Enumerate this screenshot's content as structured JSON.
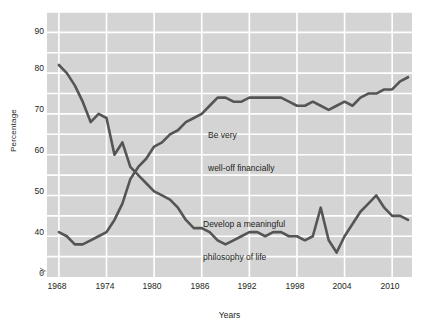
{
  "chart_data": {
    "type": "line",
    "title": "",
    "xlabel": "Years",
    "ylabel": "Percentage",
    "xlim": [
      1966.5,
      2012.5
    ],
    "ylim": [
      30,
      95
    ],
    "y_axis_break_at": 0,
    "grid": true,
    "legend_position": "inline-annotations",
    "background_color": "#d4d4d4",
    "gridline_color": "#ffffff",
    "line_color": "#555555",
    "xticks": [
      1968,
      1974,
      1980,
      1986,
      1992,
      1998,
      2004,
      2010
    ],
    "yticks": [
      0,
      40,
      50,
      60,
      70,
      80,
      90
    ],
    "ytick_labels": [
      "0",
      "40",
      "50",
      "60",
      "70",
      "80",
      "90"
    ],
    "x": [
      1968,
      1969,
      1970,
      1971,
      1972,
      1973,
      1974,
      1975,
      1976,
      1977,
      1978,
      1979,
      1980,
      1981,
      1982,
      1983,
      1984,
      1985,
      1986,
      1987,
      1988,
      1989,
      1990,
      1991,
      1992,
      1993,
      1994,
      1995,
      1996,
      1997,
      1998,
      1999,
      2000,
      2001,
      2002,
      2003,
      2004,
      2005,
      2006,
      2007,
      2008,
      2009,
      2010,
      2011,
      2012
    ],
    "series": [
      {
        "name": "Develop a meaningful philosophy of life",
        "annotation": "Develop a meaningful\nphilosophy of life",
        "color": "#555555",
        "values": [
          82,
          80,
          77,
          73,
          68,
          70,
          69,
          60,
          63,
          57,
          55,
          53,
          51,
          50,
          49,
          47,
          44,
          42,
          42,
          41,
          39,
          38,
          39,
          40,
          41,
          41,
          40,
          41,
          41,
          40,
          40,
          39,
          40,
          47,
          39,
          36,
          40,
          43,
          46,
          48,
          50,
          47,
          45,
          45,
          44
        ]
      },
      {
        "name": "Be very well-off financially",
        "annotation": "Be very\nwell-off financially",
        "color": "#555555",
        "values": [
          41,
          40,
          38,
          38,
          39,
          40,
          41,
          44,
          48,
          54,
          57,
          59,
          62,
          63,
          65,
          66,
          68,
          69,
          70,
          72,
          74,
          74,
          73,
          73,
          74,
          74,
          74,
          74,
          74,
          73,
          72,
          72,
          73,
          72,
          71,
          72,
          73,
          72,
          74,
          75,
          75,
          76,
          76,
          78,
          79
        ]
      }
    ]
  },
  "axes": {
    "ylabel": "Percentage",
    "xlabel": "Years",
    "ytick_labels": [
      "90",
      "80",
      "70",
      "60",
      "50",
      "40",
      "0"
    ],
    "xtick_labels": [
      "1968",
      "1974",
      "1980",
      "1986",
      "1992",
      "1998",
      "2004",
      "2010"
    ]
  },
  "annotations": [
    {
      "id": "well-off",
      "line1": "Be very",
      "line2": "well-off financially"
    },
    {
      "id": "philosophy",
      "line1": "Develop a meaningful",
      "line2": "philosophy of life"
    }
  ]
}
